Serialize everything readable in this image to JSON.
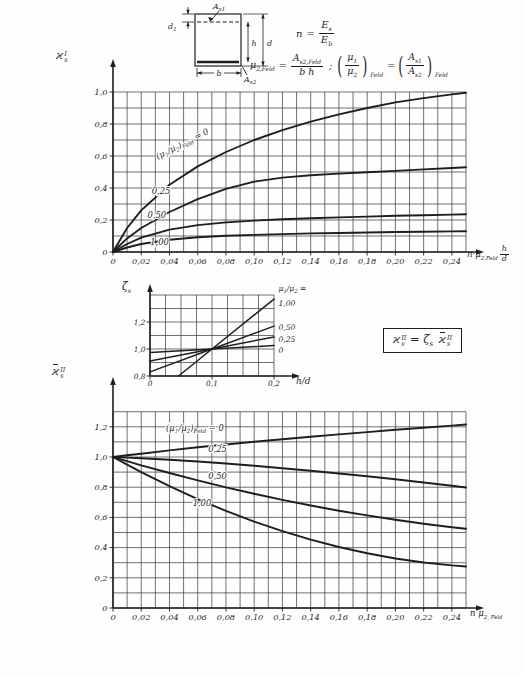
{
  "ink": "#1e1e1e",
  "paper": "#fefefe",
  "sketch": {
    "as1": {
      "main": "A",
      "sub": "s1"
    },
    "as2": {
      "main": "A",
      "sub": "s2"
    },
    "d1": {
      "main": "d",
      "sub": "1"
    },
    "h": "h",
    "d": "d",
    "b": "b"
  },
  "formulas": {
    "n": {
      "lhs": "n",
      "eq": "=",
      "num": {
        "main": "E",
        "sub": "s"
      },
      "den": {
        "main": "E",
        "sub": "b"
      }
    },
    "mu": {
      "lhs": {
        "main": "μ",
        "sub": "2,Feld"
      },
      "eq": "=",
      "num": {
        "main": "A",
        "sub": "s2,Feld"
      },
      "den": "b h",
      "sep": ";",
      "po": "(",
      "pc": ")",
      "r1num": {
        "main": "μ",
        "sub": "1"
      },
      "r1den": {
        "main": "μ",
        "sub": "2"
      },
      "r1sub": "Feld",
      "eq2": "=",
      "r2num": {
        "main": "A",
        "sub": "s1"
      },
      "r2den": {
        "main": "A",
        "sub": "s2"
      },
      "r2sub": "Feld"
    },
    "boxed": {
      "k1": {
        "main": "ϰ",
        "sup": "II",
        "sub": "s"
      },
      "eq": "=",
      "zeta": {
        "main": "ζ",
        "sub": "s"
      },
      "k2": {
        "main": "ϰ",
        "sup": "II",
        "sub": "s"
      }
    }
  },
  "y_titles": {
    "top": {
      "main": "ϰ",
      "sup": "I",
      "sub": "s"
    },
    "inset": {
      "main": "ζ",
      "sub": "s"
    },
    "bottom": {
      "main": "ϰ",
      "sup": "II",
      "sub": "s"
    }
  },
  "axis_titles": {
    "top": {
      "pre": "n·μ",
      "sub": "2,Feld",
      "frac_num": "h",
      "frac_den": "d"
    },
    "inset": "h/d",
    "bottom": {
      "pre": "n μ",
      "sub": "2, Feld"
    }
  },
  "chart_data": [
    {
      "id": "top",
      "type": "line",
      "title": "",
      "ylabel": "ϰ_s^I",
      "xlabel": "n·μ_2,Feld · h/d",
      "xlim": [
        0,
        0.25
      ],
      "ylim": [
        0,
        1.0
      ],
      "grid": {
        "dx": 0.01,
        "dy": 0.1
      },
      "x_ticks": [
        {
          "v": 0,
          "label": "0"
        },
        {
          "v": 0.02,
          "label": "0,02"
        },
        {
          "v": 0.04,
          "label": "0,04"
        },
        {
          "v": 0.06,
          "label": "0,06"
        },
        {
          "v": 0.08,
          "label": "0,08"
        },
        {
          "v": 0.1,
          "label": "0,10"
        },
        {
          "v": 0.12,
          "label": "0,12"
        },
        {
          "v": 0.14,
          "label": "0,14"
        },
        {
          "v": 0.16,
          "label": "0,16"
        },
        {
          "v": 0.18,
          "label": "0,18"
        },
        {
          "v": 0.2,
          "label": "0,20"
        },
        {
          "v": 0.22,
          "label": "0,22"
        },
        {
          "v": 0.24,
          "label": "0,24"
        }
      ],
      "y_ticks": [
        {
          "v": 1.0,
          "label": "1,0"
        },
        {
          "v": 0.8,
          "label": "0,8"
        },
        {
          "v": 0.6,
          "label": "0,6"
        },
        {
          "v": 0.4,
          "label": "0,4"
        },
        {
          "v": 0.2,
          "label": "0,2"
        },
        {
          "v": 0,
          "label": "0"
        }
      ],
      "series": [
        {
          "name": "(μ1/μ2)Feld = 0",
          "label_parts": [
            {
              "t": "("
            },
            {
              "t": "μ"
            },
            {
              "t": "1",
              "sub": true
            },
            {
              "t": "/μ"
            },
            {
              "t": "2",
              "sub": true
            },
            {
              "t": ")"
            },
            {
              "t": "Feld",
              "sub": true
            },
            {
              "t": " = 0"
            }
          ],
          "label_pos": [
            0.05,
            0.66
          ],
          "label_rot": -27,
          "x": [
            0,
            0.01,
            0.02,
            0.04,
            0.06,
            0.08,
            0.1,
            0.12,
            0.14,
            0.16,
            0.18,
            0.2,
            0.22,
            0.24,
            0.25
          ],
          "y": [
            0,
            0.15,
            0.26,
            0.42,
            0.535,
            0.625,
            0.7,
            0.762,
            0.815,
            0.86,
            0.9,
            0.935,
            0.962,
            0.985,
            0.995
          ]
        },
        {
          "name": "0,25",
          "label_parts": [
            {
              "t": "0,25"
            }
          ],
          "label_pos": [
            0.034,
            0.36
          ],
          "label_rot": 0,
          "x": [
            0,
            0.01,
            0.02,
            0.04,
            0.06,
            0.08,
            0.1,
            0.12,
            0.14,
            0.16,
            0.18,
            0.2,
            0.22,
            0.24,
            0.25
          ],
          "y": [
            0,
            0.085,
            0.15,
            0.25,
            0.33,
            0.395,
            0.44,
            0.465,
            0.48,
            0.49,
            0.498,
            0.507,
            0.516,
            0.525,
            0.53
          ]
        },
        {
          "name": "0,50",
          "label_parts": [
            {
              "t": "0,50"
            }
          ],
          "label_pos": [
            0.031,
            0.215
          ],
          "label_rot": 0,
          "x": [
            0,
            0.01,
            0.02,
            0.04,
            0.06,
            0.08,
            0.1,
            0.12,
            0.14,
            0.16,
            0.18,
            0.2,
            0.22,
            0.24,
            0.25
          ],
          "y": [
            0,
            0.05,
            0.09,
            0.14,
            0.168,
            0.185,
            0.196,
            0.205,
            0.211,
            0.216,
            0.221,
            0.226,
            0.23,
            0.234,
            0.236
          ]
        },
        {
          "name": "1,00",
          "label_parts": [
            {
              "t": "1,00"
            }
          ],
          "label_pos": [
            0.033,
            0.042
          ],
          "label_rot": 0,
          "x": [
            0,
            0.01,
            0.02,
            0.04,
            0.06,
            0.08,
            0.1,
            0.12,
            0.14,
            0.16,
            0.18,
            0.2,
            0.22,
            0.24,
            0.25
          ],
          "y": [
            0,
            0.028,
            0.05,
            0.077,
            0.092,
            0.101,
            0.107,
            0.112,
            0.116,
            0.119,
            0.122,
            0.125,
            0.127,
            0.129,
            0.13
          ]
        }
      ]
    },
    {
      "id": "inset",
      "type": "line",
      "title": "",
      "ylabel": "ζ_s",
      "xlabel": "h/d",
      "xlim": [
        0,
        0.2
      ],
      "ylim": [
        0.8,
        1.4
      ],
      "grid": {
        "dx": 0.025,
        "dy": 0.1
      },
      "x_ticks": [
        {
          "v": 0,
          "label": "0"
        },
        {
          "v": 0.1,
          "label": "0,1"
        },
        {
          "v": 0.2,
          "label": "0,2"
        }
      ],
      "y_ticks": [
        {
          "v": 1.2,
          "label": "1,2"
        },
        {
          "v": 1.0,
          "label": "1,0"
        },
        {
          "v": 0.8,
          "label": "0,8"
        }
      ],
      "legend_title_parts": [
        {
          "t": "μ"
        },
        {
          "t": "1",
          "sub": true
        },
        {
          "t": "/μ"
        },
        {
          "t": "2",
          "sub": true
        },
        {
          "t": " ="
        }
      ],
      "series": [
        {
          "name": "1,00",
          "side_label": "1,00",
          "side_dy": 7,
          "x": [
            0.046,
            0.1,
            0.2
          ],
          "y": [
            0.8,
            1.0,
            1.37
          ]
        },
        {
          "name": "0,50",
          "side_label": "0,50",
          "side_dy": 4,
          "x": [
            0,
            0.1,
            0.2
          ],
          "y": [
            0.83,
            1.0,
            1.17
          ]
        },
        {
          "name": "0,25",
          "side_label": "0,25",
          "side_dy": 5,
          "x": [
            0,
            0.1,
            0.2
          ],
          "y": [
            0.91,
            1.0,
            1.09
          ]
        },
        {
          "name": "0",
          "side_label": "0",
          "side_dy": 7,
          "x": [
            0,
            0.1,
            0.2
          ],
          "y": [
            0.975,
            1.0,
            1.025
          ]
        }
      ]
    },
    {
      "id": "bottom",
      "type": "line",
      "title": "",
      "ylabel": "ϰ̄_s^II",
      "xlabel": "n μ_2,Feld",
      "xlim": [
        0,
        0.25
      ],
      "ylim": [
        0,
        1.3
      ],
      "grid": {
        "dx": 0.01,
        "dy": 0.1
      },
      "x_ticks": [
        {
          "v": 0,
          "label": "0"
        },
        {
          "v": 0.02,
          "label": "0,02"
        },
        {
          "v": 0.04,
          "label": "0,04"
        },
        {
          "v": 0.06,
          "label": "0,06"
        },
        {
          "v": 0.08,
          "label": "0,08"
        },
        {
          "v": 0.1,
          "label": "0,10"
        },
        {
          "v": 0.12,
          "label": "0,12"
        },
        {
          "v": 0.14,
          "label": "0,14"
        },
        {
          "v": 0.16,
          "label": "0,16"
        },
        {
          "v": 0.18,
          "label": "0,18"
        },
        {
          "v": 0.2,
          "label": "0,20"
        },
        {
          "v": 0.22,
          "label": "0,22"
        },
        {
          "v": 0.24,
          "label": "0,24"
        }
      ],
      "y_ticks": [
        {
          "v": 1.2,
          "label": "1,2"
        },
        {
          "v": 1.0,
          "label": "1,0"
        },
        {
          "v": 0.8,
          "label": "0,8"
        },
        {
          "v": 0.6,
          "label": "0,6"
        },
        {
          "v": 0.4,
          "label": "0,4"
        },
        {
          "v": 0.2,
          "label": "0,2"
        },
        {
          "v": 0,
          "label": "0"
        }
      ],
      "series": [
        {
          "name": "(μ1/μ2)Feld = 0",
          "label_parts": [
            {
              "t": "("
            },
            {
              "t": "μ"
            },
            {
              "t": "1",
              "sub": true
            },
            {
              "t": "/μ"
            },
            {
              "t": "2",
              "sub": true
            },
            {
              "t": ")"
            },
            {
              "t": "Feld",
              "sub": true
            },
            {
              "t": " = 0"
            }
          ],
          "label_pos": [
            0.058,
            1.175
          ],
          "label_rot": 0,
          "x": [
            0,
            0.01,
            0.02,
            0.04,
            0.06,
            0.08,
            0.1,
            0.12,
            0.14,
            0.16,
            0.18,
            0.2,
            0.22,
            0.24,
            0.25
          ],
          "y": [
            1.0,
            1.011,
            1.022,
            1.044,
            1.064,
            1.083,
            1.101,
            1.118,
            1.134,
            1.15,
            1.165,
            1.18,
            1.194,
            1.208,
            1.215
          ]
        },
        {
          "name": "0,25",
          "label_parts": [
            {
              "t": "0,25"
            }
          ],
          "label_pos": [
            0.074,
            1.035
          ],
          "label_rot": 0,
          "x": [
            0,
            0.01,
            0.02,
            0.04,
            0.06,
            0.08,
            0.1,
            0.12,
            0.14,
            0.16,
            0.18,
            0.2,
            0.22,
            0.24,
            0.25
          ],
          "y": [
            1.0,
            0.996,
            0.992,
            0.982,
            0.97,
            0.957,
            0.942,
            0.926,
            0.909,
            0.891,
            0.872,
            0.852,
            0.831,
            0.809,
            0.798
          ]
        },
        {
          "name": "0,50",
          "label_parts": [
            {
              "t": "0,50"
            }
          ],
          "label_pos": [
            0.074,
            0.855
          ],
          "label_rot": 0,
          "x": [
            0,
            0.01,
            0.02,
            0.04,
            0.06,
            0.08,
            0.1,
            0.12,
            0.14,
            0.16,
            0.18,
            0.2,
            0.22,
            0.24,
            0.25
          ],
          "y": [
            1.0,
            0.972,
            0.945,
            0.894,
            0.845,
            0.799,
            0.756,
            0.716,
            0.679,
            0.644,
            0.613,
            0.584,
            0.558,
            0.535,
            0.525
          ]
        },
        {
          "name": "1,00",
          "label_parts": [
            {
              "t": "1,00"
            }
          ],
          "label_pos": [
            0.063,
            0.675
          ],
          "label_rot": 0,
          "x": [
            0,
            0.01,
            0.02,
            0.04,
            0.06,
            0.08,
            0.1,
            0.12,
            0.14,
            0.16,
            0.18,
            0.2,
            0.22,
            0.24,
            0.25
          ],
          "y": [
            1.0,
            0.949,
            0.9,
            0.807,
            0.721,
            0.643,
            0.572,
            0.509,
            0.452,
            0.404,
            0.362,
            0.328,
            0.301,
            0.282,
            0.275
          ]
        }
      ]
    }
  ]
}
